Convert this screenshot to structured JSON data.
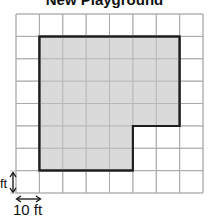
{
  "title": "New Playground",
  "grid": {
    "columns": 8,
    "rows": 8,
    "origin_x": 16,
    "origin_y": 14,
    "cell_w": 23.375,
    "cell_h": 22.375,
    "line_color": "#a9a9a9",
    "background": "#ffffff"
  },
  "shape": {
    "name": "playground",
    "fill": "#d3d3d3",
    "stroke": "#1e1e1e",
    "vertices_in_cells": [
      [
        1,
        1
      ],
      [
        7,
        1
      ],
      [
        7,
        5
      ],
      [
        5,
        5
      ],
      [
        5,
        7
      ],
      [
        1,
        7
      ]
    ]
  },
  "scale": {
    "vertical_label": "ft",
    "horizontal_label": "10 ft"
  }
}
